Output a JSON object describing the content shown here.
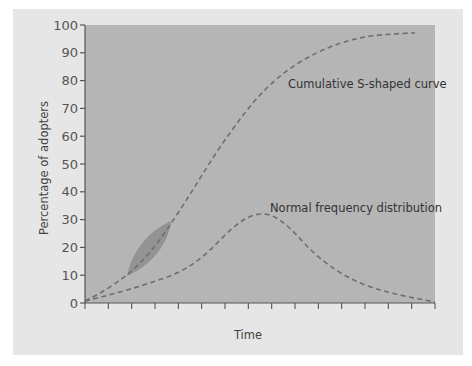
{
  "chart_data": {
    "type": "line",
    "title": "",
    "xlabel": "Time",
    "ylabel": "Percentage of adopters",
    "ylim": [
      0,
      100
    ],
    "yticks": [
      0,
      10,
      20,
      30,
      40,
      50,
      60,
      70,
      80,
      90,
      100
    ],
    "xticks_count": 16,
    "xtick_labels": [],
    "grid": false,
    "legend": "none (inline curve annotations)",
    "colors": {
      "card_background": "#e6e6e6",
      "plot_background": "#b5b5b5",
      "curve_stroke": "#6e6e6e",
      "highlight_fill": "#8f8f8f"
    },
    "series": [
      {
        "name": "Cumulative S-shaped curve",
        "style": "dashed",
        "x": [
          0,
          1,
          2,
          3,
          4,
          5,
          6,
          7,
          8,
          9,
          10,
          11,
          12,
          13,
          14
        ],
        "values": [
          1,
          5,
          11,
          20,
          30,
          42,
          56,
          70,
          80,
          87,
          92,
          94.5,
          96,
          97,
          97
        ]
      },
      {
        "name": "Normal frequency distribution",
        "style": "dashed",
        "x": [
          0,
          1,
          2,
          3,
          4,
          5,
          6,
          7,
          8,
          9,
          10,
          11,
          12,
          13,
          14,
          15
        ],
        "values": [
          1,
          3,
          5.5,
          8.5,
          12,
          17,
          25,
          31,
          32,
          29,
          22,
          15,
          10,
          6.5,
          3.5,
          0.5
        ]
      }
    ],
    "annotations": [
      {
        "text": "Cumulative S-shaped curve",
        "anchor": "upper right, beside S-curve near 76%"
      },
      {
        "text": "Normal frequency distribution",
        "anchor": "right of normal curve peak near 34%"
      },
      {
        "shape": "leaf-shaped highlight",
        "along": "S-curve",
        "y_range": [
          10,
          30
        ]
      }
    ]
  },
  "axis": {
    "y_labels": [
      "0",
      "10",
      "20",
      "30",
      "40",
      "50",
      "60",
      "70",
      "80",
      "90",
      "100"
    ],
    "y_title": "Percentage of adopters",
    "x_title": "Time"
  },
  "labels": {
    "s_curve": "Cumulative S-shaped curve",
    "normal_curve": "Normal frequency distribution"
  }
}
